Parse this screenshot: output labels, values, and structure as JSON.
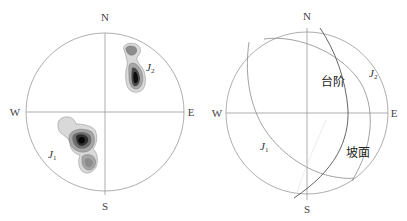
{
  "left_stereonet": {
    "directions": {
      "north": "N",
      "south": "S",
      "west": "W",
      "east": "E"
    },
    "sets": [
      {
        "name": "J",
        "subscript": "1"
      },
      {
        "name": "J",
        "subscript": "2"
      }
    ],
    "contour_colors": [
      "#d9d9d9",
      "#a6a6a6",
      "#6e6e6e",
      "#3a3a3a",
      "#0d0d0d"
    ]
  },
  "right_stereonet": {
    "directions": {
      "north": "N",
      "south": "S",
      "west": "W",
      "east": "E"
    },
    "planes": [
      {
        "name": "J",
        "subscript": "1"
      },
      {
        "name": "J",
        "subscript": "2"
      }
    ],
    "labels": {
      "bench": "台阶",
      "slope": "坡面"
    },
    "line_color": "#8a8a8a"
  }
}
